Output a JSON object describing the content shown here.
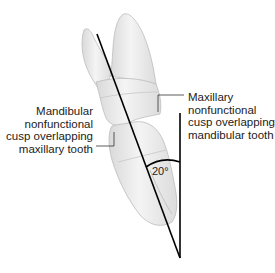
{
  "diagram": {
    "labels": {
      "mandibular": [
        "Mandibular",
        "nonfunctional",
        "cusp overlapping",
        "maxillary tooth"
      ],
      "maxillary": [
        "Maxillary",
        "nonfunctional",
        "cusp overlapping",
        "mandibular tooth"
      ],
      "angle": "20°"
    },
    "colors": {
      "tooth_fill": "#ececec",
      "tooth_shadow": "#cfcfcf",
      "tooth_outline": "#bdbdbd",
      "axis_line": "#000000",
      "leader_line": "#333333",
      "text": "#222222"
    },
    "geometry": {
      "axis_line": {
        "x1": 97,
        "y1": 34,
        "x2": 180,
        "y2": 258
      },
      "vertical_line": {
        "x1": 180,
        "y1": 113,
        "x2": 180,
        "y2": 258
      },
      "angle_degrees": 20
    }
  }
}
